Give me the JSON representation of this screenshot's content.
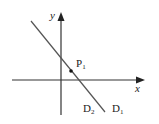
{
  "diagram": {
    "type": "coordinate-plane",
    "axes": {
      "x_label": "x",
      "y_label": "y",
      "origin": [
        61,
        80
      ],
      "x_axis": {
        "from": [
          12,
          80
        ],
        "to": [
          145,
          80
        ]
      },
      "y_axis": {
        "from": [
          61,
          115
        ],
        "to": [
          61,
          12
        ]
      }
    },
    "lines": [
      {
        "name": "D1",
        "label": "D",
        "subscript": "1",
        "from": [
          31,
          21
        ],
        "to": [
          105,
          112
        ]
      },
      {
        "name": "D2",
        "label": "D",
        "subscript": "2",
        "from": [
          31,
          21
        ],
        "to": [
          105,
          112
        ]
      }
    ],
    "points": [
      {
        "name": "P1",
        "label": "P",
        "subscript": "1",
        "at": [
          71,
          71
        ]
      }
    ],
    "colors": {
      "stroke": "#333333",
      "line": "#555555",
      "text": "#222222"
    }
  }
}
